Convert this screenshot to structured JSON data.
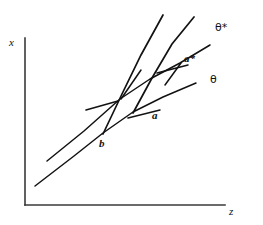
{
  "figure": {
    "background_color": "#ffffff",
    "ink_color": "#121212",
    "axis_color": "#3a3a3a",
    "width": 263,
    "height": 225
  },
  "axes": {
    "y_axis": {
      "name": "vertical-axis",
      "label": "x",
      "label_x": 9,
      "label_y": 37,
      "x": 25,
      "y_top": 38,
      "y_bottom": 205
    },
    "x_axis": {
      "name": "horizontal-axis",
      "label": "z",
      "label_x": 229,
      "label_y": 206,
      "y": 205,
      "x_left": 25,
      "x_right": 225
    }
  },
  "curves": [
    {
      "name": "theta-locus",
      "label": "θ",
      "label_x": 210,
      "label_y": 74,
      "path": "M 35,186 L 74,156 L 103,133 L 133,112 L 163,97 L 196,83",
      "description": "lower concave locus passing through points b and a"
    },
    {
      "name": "theta-star-locus",
      "label": "θ*",
      "label_x": 215,
      "label_y": 22,
      "path": "M 47,161 L 84,131 L 120,99 L 150,79 L 180,63 L 210,45",
      "description": "upper concave locus passing through point a*"
    }
  ],
  "steep_lines": [
    {
      "name": "steep-line-through-b",
      "path": "M 103,134 L 122,94 L 141,55 L 163,15",
      "description": "steep ray rising from point b through the theta-star locus"
    },
    {
      "name": "steep-line-through-a",
      "path": "M 133,113 L 152,78 L 172,44 L 194,17",
      "description": "steep ray rising from point a through point a*"
    }
  ],
  "tangent_segments": [
    {
      "name": "tangent-segment-left-lower",
      "path": "M 86,110 L 118,101",
      "description": "short flat tangent stroke left of the b crossing"
    },
    {
      "name": "tangent-segment-left-upper",
      "path": "M 141,70 L 121,99",
      "description": "short steep tangent stroke above the b crossing"
    },
    {
      "name": "tangent-segment-mid-lower",
      "path": "M 128,118 L 160,110",
      "description": "short flat tangent stroke left of point a"
    },
    {
      "name": "tangent-segment-right-lower",
      "path": "M 157,73 L 188,65",
      "description": "short flat tangent stroke left of point a*"
    },
    {
      "name": "tangent-segment-right-upper",
      "path": "M 181,63 L 165,85",
      "description": "short steep tangent stroke below point a*"
    }
  ],
  "points": [
    {
      "name": "point-b",
      "label": "b",
      "x": 103,
      "y": 134,
      "label_x": 99,
      "label_y": 138
    },
    {
      "name": "point-a",
      "label": "a",
      "x": 133,
      "y": 113,
      "label_x": 152,
      "label_y": 110
    },
    {
      "name": "point-a-star",
      "label": "a*",
      "x": 180,
      "y": 63,
      "label_x": 184,
      "label_y": 53
    }
  ]
}
